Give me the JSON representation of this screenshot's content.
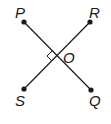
{
  "diagram": {
    "points": [
      {
        "id": "P",
        "label": "P",
        "x": 24,
        "y": 22
      },
      {
        "id": "R",
        "label": "R",
        "x": 90,
        "y": 22
      },
      {
        "id": "S",
        "label": "S",
        "x": 24,
        "y": 89
      },
      {
        "id": "Q",
        "label": "Q",
        "x": 91,
        "y": 90
      }
    ],
    "center": {
      "id": "O",
      "label": "O",
      "x": 57,
      "y": 56
    },
    "segments": [
      {
        "from": "P",
        "to": "Q"
      },
      {
        "from": "R",
        "to": "S"
      }
    ],
    "right_angle_marker": {
      "at": "O",
      "side": "left"
    },
    "colors": {
      "line": "#1a1a1a",
      "background": "#ffffff"
    }
  }
}
